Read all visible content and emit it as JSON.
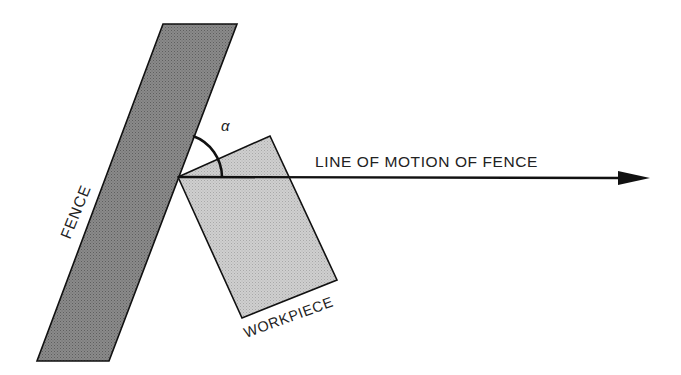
{
  "diagram": {
    "labels": {
      "fence": "FENCE",
      "workpiece": "WORKPIECE",
      "line_of_motion": "LINE OF MOTION OF FENCE",
      "angle": "α"
    },
    "colors": {
      "fence_fill": "#808080",
      "workpiece_fill": "#c6c6c6",
      "stroke": "#111111",
      "background": "#ffffff"
    }
  }
}
